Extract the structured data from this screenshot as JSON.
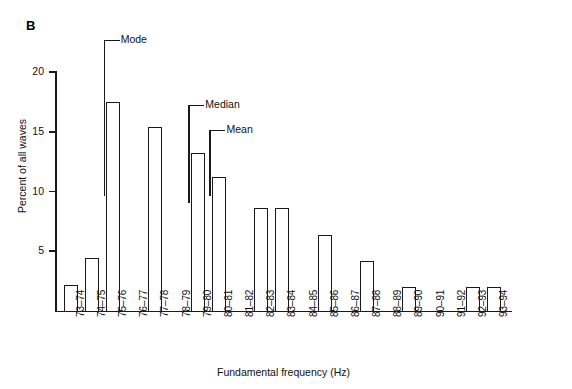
{
  "figure": {
    "panel_label": "B"
  },
  "chart_data": {
    "type": "bar",
    "title": "",
    "xlabel": "Fundamental frequency (Hz)",
    "ylabel": "Percent of all waves",
    "categories": [
      "73–74",
      "74–75",
      "75–76",
      "76–77",
      "77–78",
      "78–79",
      "79–80",
      "80–81",
      "81–82",
      "82–83",
      "83–84",
      "84–85",
      "85–86",
      "86–87",
      "87–88",
      "88–89",
      "89–90",
      "90–91",
      "91–92",
      "92–93",
      "93–94"
    ],
    "values": [
      2.2,
      4.4,
      17.5,
      0,
      15.4,
      0,
      13.2,
      11.2,
      0,
      8.6,
      8.6,
      0,
      6.4,
      0,
      4.2,
      0,
      2.0,
      0,
      0,
      2.0,
      2.0
    ],
    "ylim": [
      0,
      20
    ],
    "yticks": [
      5,
      10,
      15,
      20
    ],
    "ytick_labels": [
      "5",
      "10",
      "15",
      "20"
    ],
    "grid": false,
    "legend": "none",
    "annotations": [
      {
        "label": "Mode",
        "category": "75–76",
        "value": 17.5
      },
      {
        "label": "Median",
        "category": "79–80",
        "value": 13.2
      },
      {
        "label": "Mean",
        "category": "80–81",
        "value": 11.2
      }
    ]
  },
  "colors": {
    "ink": "#1a1a1a",
    "background": "#ffffff"
  }
}
